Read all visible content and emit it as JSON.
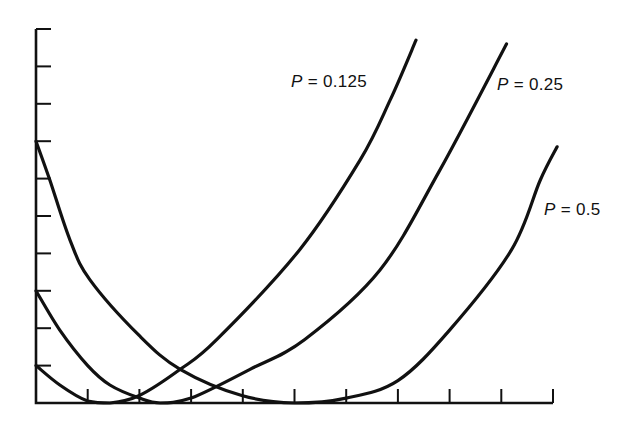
{
  "chart_data": {
    "type": "line",
    "title": "",
    "xlabel": "",
    "ylabel": "",
    "xlim": [
      0,
      10
    ],
    "ylim": [
      0,
      10
    ],
    "x_ticks": [
      0,
      1,
      2,
      3,
      4,
      5,
      6,
      7,
      8,
      9,
      10
    ],
    "y_ticks": [
      0,
      1,
      2,
      3,
      4,
      5,
      6,
      7,
      8,
      9,
      10
    ],
    "x_tick_labels": [],
    "y_tick_labels": [],
    "grid": false,
    "legend": "inline curve labels",
    "series": [
      {
        "name": "P = 0.125",
        "label_var": "P",
        "label_value": "0.125",
        "points": [
          [
            0,
            1.0
          ],
          [
            0.46,
            0.48
          ],
          [
            1.0,
            0.05
          ],
          [
            1.43,
            0.0
          ],
          [
            2.0,
            0.2
          ],
          [
            2.79,
            0.9
          ],
          [
            3.5,
            1.7
          ],
          [
            5.1,
            4.1
          ],
          [
            6.27,
            6.5
          ],
          [
            6.85,
            8.1
          ],
          [
            7.35,
            9.7
          ]
        ]
      },
      {
        "name": "P = 0.25",
        "label_var": "P",
        "label_value": "0.25",
        "points": [
          [
            0,
            3.0
          ],
          [
            0.46,
            1.95
          ],
          [
            1.0,
            1.0
          ],
          [
            1.43,
            0.48
          ],
          [
            2.0,
            0.13
          ],
          [
            2.4,
            0.0
          ],
          [
            3.0,
            0.13
          ],
          [
            4.14,
            0.9
          ],
          [
            5.2,
            1.7
          ],
          [
            6.65,
            3.55
          ],
          [
            7.8,
            6.2
          ],
          [
            9.1,
            9.6
          ]
        ]
      },
      {
        "name": "P = 0.5",
        "label_var": "P",
        "label_value": "0.5",
        "points": [
          [
            0,
            7.0
          ],
          [
            0.27,
            5.95
          ],
          [
            0.66,
            4.35
          ],
          [
            1.04,
            3.3
          ],
          [
            2.0,
            1.8
          ],
          [
            2.79,
            0.9
          ],
          [
            3.98,
            0.2
          ],
          [
            5.0,
            0.0
          ],
          [
            6.0,
            0.13
          ],
          [
            7.0,
            0.6
          ],
          [
            8.0,
            1.95
          ],
          [
            9.2,
            4.1
          ],
          [
            9.75,
            5.95
          ],
          [
            10.08,
            6.85
          ]
        ]
      }
    ]
  },
  "labels": [
    {
      "var": "P",
      "eq": " = ",
      "value": "0.125"
    },
    {
      "var": "P",
      "eq": " = ",
      "value": "0.25"
    },
    {
      "var": "P",
      "eq": " = ",
      "value": "0.5"
    }
  ]
}
